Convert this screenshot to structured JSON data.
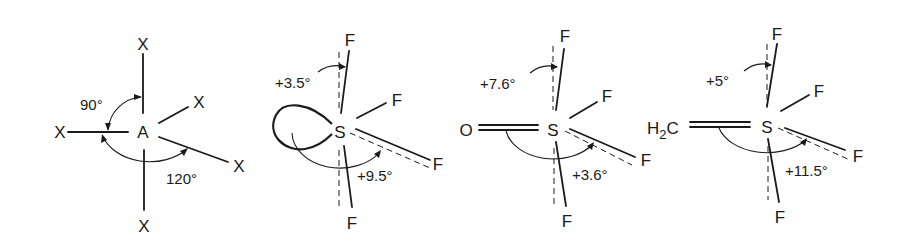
{
  "figure": {
    "panels": [
      {
        "id": "generic-AX5",
        "center_atom": "A",
        "ligands": [
          "X",
          "X",
          "X",
          "X",
          "X"
        ],
        "angles": [
          {
            "label": "90°",
            "between": "axial-X / equatorial-X"
          },
          {
            "label": "120°",
            "between": "equatorial-X / equatorial-X"
          }
        ]
      },
      {
        "id": "SF4",
        "center_atom": "S",
        "substituent": "lone pair",
        "ligands": [
          "F",
          "F",
          "F",
          "F"
        ],
        "angles": [
          {
            "label": "+3.5°",
            "between": "axial deviation"
          },
          {
            "label": "+9.5°",
            "between": "equatorial deviation"
          }
        ]
      },
      {
        "id": "OSF4",
        "center_atom": "S",
        "substituent": "O",
        "ligands": [
          "F",
          "F",
          "F",
          "F"
        ],
        "angles": [
          {
            "label": "+7.6°",
            "between": "axial deviation"
          },
          {
            "label": "+3.6°",
            "between": "equatorial deviation"
          }
        ]
      },
      {
        "id": "H2CSF4",
        "center_atom": "S",
        "substituent": "H2C",
        "substituent_parts": {
          "main": "H",
          "sub": "2",
          "tail": "C"
        },
        "ligands": [
          "F",
          "F",
          "F",
          "F"
        ],
        "angles": [
          {
            "label": "+5°",
            "between": "axial deviation"
          },
          {
            "label": "+11.5°",
            "between": "equatorial deviation"
          }
        ]
      }
    ]
  }
}
